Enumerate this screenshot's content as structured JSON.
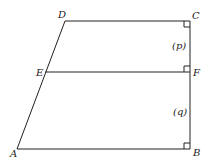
{
  "diagram": {
    "points": {
      "A": {
        "label": "A",
        "x": 17,
        "y": 149
      },
      "B": {
        "label": "B",
        "x": 190,
        "y": 149
      },
      "C": {
        "label": "C",
        "x": 190,
        "y": 21
      },
      "D": {
        "label": "D",
        "x": 65,
        "y": 21
      },
      "E": {
        "label": "E",
        "x": 45,
        "y": 72
      },
      "F": {
        "label": "F",
        "x": 190,
        "y": 72
      }
    },
    "segment_labels": {
      "p": "(p)",
      "q": "(q)"
    },
    "right_angles": [
      "C",
      "F",
      "B"
    ]
  }
}
